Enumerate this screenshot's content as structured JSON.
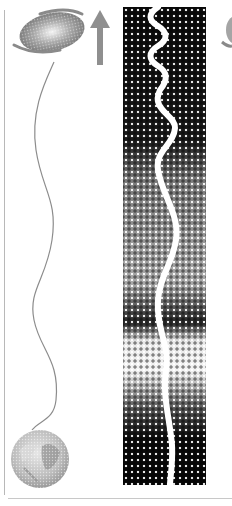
{
  "figure": {
    "elements": {
      "galaxy_icon": "spiral-galaxy-s-shape",
      "arrow_icon": "up-arrow",
      "planet_icon": "earth-globe",
      "left_wave": "thin-grey-sine-wave",
      "right_strip": "halftone-gradient-strip",
      "right_wave": "thick-white-sine-wave",
      "partial_galaxy_icon": "spiral-galaxy-s-shape-cropped"
    },
    "colors": {
      "galaxy": "#8a8a8a",
      "arrow": "#8f8f8f",
      "left_wave": "#8c8c8c",
      "strip_dark": "#0a0a0a",
      "strip_mid": "#9a9a9a",
      "right_wave": "#ffffff",
      "rules": "#b8b8b8"
    }
  }
}
